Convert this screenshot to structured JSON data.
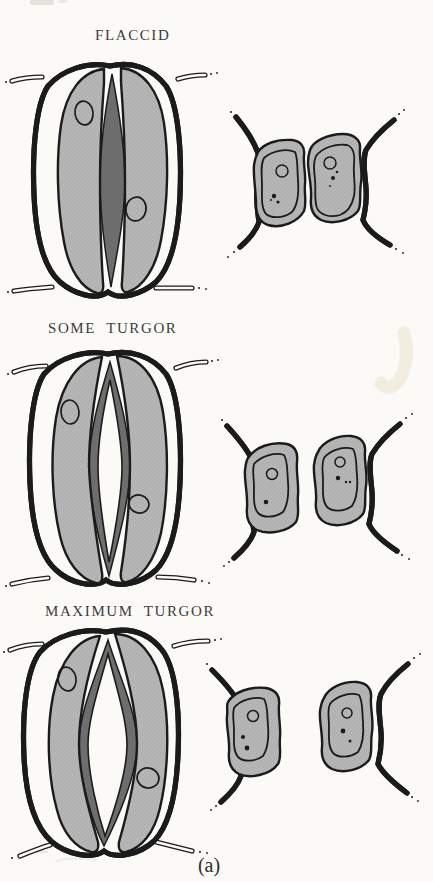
{
  "page": {
    "caption": "(a)",
    "background": "#fbfaf7"
  },
  "colors": {
    "cell_fill": "#b6b6b6",
    "cell_stipple": "#a0a0a0",
    "stoma_dark": "#6f6f6f",
    "stoma_stipple": "#5e5e5e",
    "outline": "#1b1b1b",
    "label_text": "#3d3d3d",
    "highlight": "#efecdd"
  },
  "panels": [
    {
      "id": "flaccid",
      "label": "FLACCID",
      "stoma_state": "closed"
    },
    {
      "id": "some-turgor",
      "label": "SOME TURGOR",
      "stoma_state": "slightly open"
    },
    {
      "id": "maximum-turgor",
      "label": "MAXIMUM TURGOR",
      "stoma_state": "wide open"
    }
  ]
}
